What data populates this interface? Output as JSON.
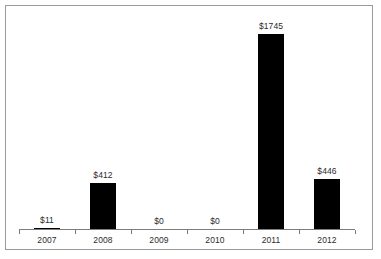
{
  "chart_data": {
    "type": "bar",
    "title": "",
    "subtitle": "",
    "xlabel": "",
    "ylabel": "",
    "categories": [
      "2007",
      "2008",
      "2009",
      "2010",
      "2011",
      "2012"
    ],
    "values": [
      11,
      412,
      0,
      0,
      1745,
      446
    ],
    "data_labels": [
      "$11",
      "$412",
      "$0",
      "$0",
      "$1745",
      "$446"
    ],
    "ylim": [
      0,
      1940
    ],
    "grid": false,
    "legend": null,
    "bar_color": "#000000",
    "axis_color": "#7d7d7d",
    "text_color": "#2b2b2b",
    "frame_color": "#9a9a9a",
    "background": "#ffffff"
  }
}
